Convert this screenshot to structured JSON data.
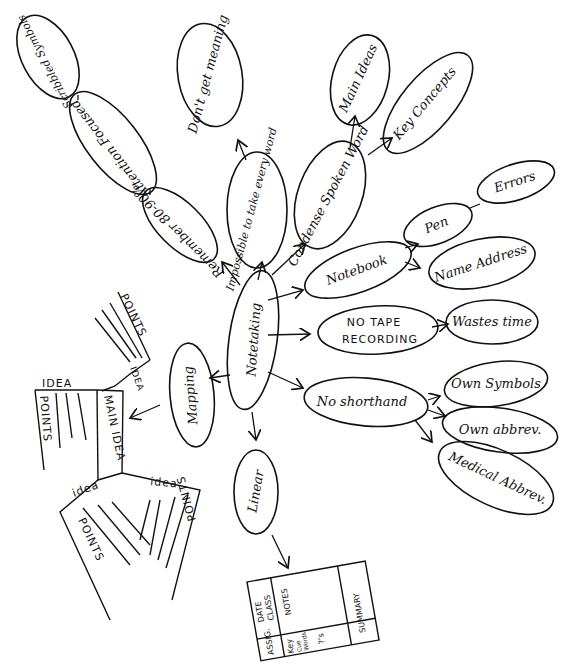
{
  "center": {
    "label": "Notetaking"
  },
  "branches": {
    "remember": {
      "label": "Remember 80-90%"
    },
    "attention": {
      "label": "Attention Focused"
    },
    "scribbled": {
      "label": "Scribbled Symbols"
    },
    "impossible": {
      "label": "Impossible to take every word"
    },
    "dont_get": {
      "label": "Don't get meaning"
    },
    "condense": {
      "label": "Condense Spoken Word"
    },
    "main_ideas": {
      "label": "Main Ideas"
    },
    "key_concepts": {
      "label": "Key Concepts"
    },
    "notebook": {
      "label": "Notebook"
    },
    "pen": {
      "label": "Pen"
    },
    "errors": {
      "label": "Errors"
    },
    "name_address": {
      "label": "Name Address"
    },
    "no_tape": {
      "line1": "NO TAPE",
      "line2": "RECORDING"
    },
    "wastes_time": {
      "label": "Wastes time"
    },
    "no_shorthand": {
      "label": "No shorthand"
    },
    "own_symbols": {
      "label": "Own Symbols"
    },
    "own_abbrev": {
      "label": "Own abbrev."
    },
    "medical_abbrev": {
      "label": "Medical Abbrev."
    },
    "mapping": {
      "label": "Mapping"
    },
    "linear": {
      "label": "Linear"
    }
  },
  "mapping_sketch": {
    "main_idea": "MAIN IDEA",
    "idea": "IDEA",
    "idea_lower": "idea",
    "points": "POINTS"
  },
  "linear_grid": {
    "assig": "ASSIG.",
    "date": "DATE",
    "class": "CLASS",
    "notes": "NOTES",
    "key": "Key",
    "cue": "Cue",
    "words": "Words",
    "qs": "?'s",
    "summary": "SUMMARY"
  }
}
